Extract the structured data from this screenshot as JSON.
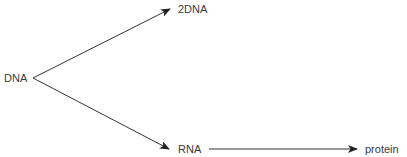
{
  "diagram": {
    "type": "flow",
    "colors": {
      "line": "#333333",
      "text": "#3a3a3a",
      "background": "#ffffff"
    },
    "nodes": [
      {
        "id": "dna",
        "label": "DNA"
      },
      {
        "id": "2dna",
        "label": "2DNA"
      },
      {
        "id": "rna",
        "label": "RNA"
      },
      {
        "id": "protein",
        "label": "protein"
      }
    ],
    "edges": [
      {
        "from": "DNA",
        "to": "2DNA"
      },
      {
        "from": "DNA",
        "to": "RNA"
      },
      {
        "from": "RNA",
        "to": "protein"
      }
    ]
  }
}
